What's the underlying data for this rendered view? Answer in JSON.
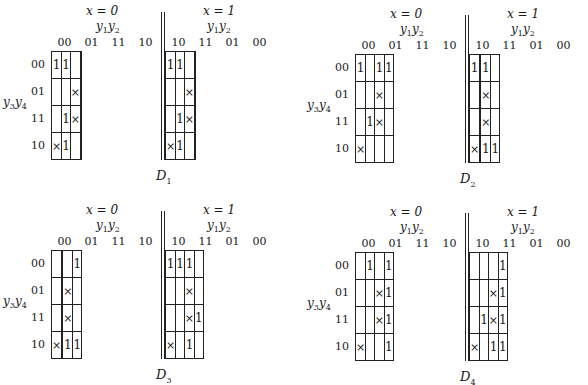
{
  "labels": {
    "x0": "x = 0",
    "x1": "x = 1",
    "col_var": "y",
    "col_var_sub1": "1",
    "col_var_sub2": "2",
    "row_var": "y",
    "row_var_sub1": "3",
    "row_var_sub2": "4",
    "left_cols": [
      "00",
      "01",
      "11",
      "10"
    ],
    "right_cols": [
      "10",
      "11",
      "01",
      "00"
    ],
    "rows": [
      "00",
      "01",
      "11",
      "10"
    ]
  },
  "maps": [
    {
      "title": "D",
      "title_sub": "1",
      "left": [
        [
          "1",
          "1",
          "",
          ""
        ],
        [
          "",
          "",
          "×",
          ""
        ],
        [
          "",
          "1",
          "×",
          ""
        ],
        [
          "×",
          "1",
          "",
          ""
        ]
      ],
      "right": [
        [
          "1",
          "1",
          "",
          ""
        ],
        [
          "",
          "",
          "×",
          ""
        ],
        [
          "",
          "1",
          "×",
          ""
        ],
        [
          "×",
          "1",
          "",
          ""
        ]
      ]
    },
    {
      "title": "D",
      "title_sub": "2",
      "left": [
        [
          "1",
          "",
          "1",
          "1"
        ],
        [
          "",
          "",
          "×",
          ""
        ],
        [
          "",
          "1",
          "×",
          ""
        ],
        [
          "×",
          "",
          "",
          ""
        ]
      ],
      "right": [
        [
          "1",
          "",
          "1",
          ""
        ],
        [
          "",
          "",
          "×",
          ""
        ],
        [
          "",
          "",
          "×",
          ""
        ],
        [
          "×",
          "",
          "1",
          "1"
        ]
      ]
    },
    {
      "title": "D",
      "title_sub": "3",
      "left": [
        [
          "",
          "",
          "",
          "1"
        ],
        [
          "",
          "",
          "×",
          ""
        ],
        [
          "",
          "",
          "×",
          ""
        ],
        [
          "×",
          "",
          "1",
          "1"
        ]
      ],
      "right": [
        [
          "1",
          "1",
          "1",
          ""
        ],
        [
          "",
          "",
          "×",
          ""
        ],
        [
          "",
          "",
          "×",
          "1"
        ],
        [
          "×",
          "",
          "1",
          ""
        ]
      ]
    },
    {
      "title": "D",
      "title_sub": "4",
      "left": [
        [
          "",
          "1",
          "",
          "1"
        ],
        [
          "",
          "",
          "×",
          "1"
        ],
        [
          "",
          "",
          "×",
          "1"
        ],
        [
          "×",
          "",
          "",
          "1"
        ]
      ],
      "right": [
        [
          "",
          "",
          "",
          "1"
        ],
        [
          "",
          "",
          "×",
          "1"
        ],
        [
          "",
          "1",
          "×",
          "1"
        ],
        [
          "×",
          "",
          "1",
          "1"
        ]
      ]
    }
  ],
  "chart_data": {
    "type": "table",
    "maps": [
      {
        "name": "D1",
        "x0": {
          "cols": [
            "00",
            "01",
            "11",
            "10"
          ],
          "rows": {
            "00": [
              "1",
              "1",
              "",
              ""
            ],
            "01": [
              "",
              "",
              "×",
              ""
            ],
            "11": [
              "",
              "1",
              "×",
              ""
            ],
            "10": [
              "×",
              "1",
              "",
              ""
            ]
          }
        },
        "x1": {
          "cols": [
            "10",
            "11",
            "01",
            "00"
          ],
          "rows": {
            "00": [
              "1",
              "1",
              "",
              ""
            ],
            "01": [
              "",
              "",
              "×",
              ""
            ],
            "11": [
              "",
              "1",
              "×",
              ""
            ],
            "10": [
              "×",
              "1",
              "",
              ""
            ]
          }
        }
      },
      {
        "name": "D2",
        "x0": {
          "cols": [
            "00",
            "01",
            "11",
            "10"
          ],
          "rows": {
            "00": [
              "1",
              "",
              "1",
              "1"
            ],
            "01": [
              "",
              "",
              "×",
              ""
            ],
            "11": [
              "",
              "1",
              "×",
              ""
            ],
            "10": [
              "×",
              "",
              "",
              ""
            ]
          }
        },
        "x1": {
          "cols": [
            "10",
            "11",
            "01",
            "00"
          ],
          "rows": {
            "00": [
              "1",
              "",
              "1",
              ""
            ],
            "01": [
              "",
              "",
              "×",
              ""
            ],
            "11": [
              "",
              "",
              "×",
              ""
            ],
            "10": [
              "×",
              "",
              "1",
              "1"
            ]
          }
        }
      },
      {
        "name": "D3",
        "x0": {
          "cols": [
            "00",
            "01",
            "11",
            "10"
          ],
          "rows": {
            "00": [
              "",
              "",
              "",
              "1"
            ],
            "01": [
              "",
              "",
              "×",
              ""
            ],
            "11": [
              "",
              "",
              "×",
              ""
            ],
            "10": [
              "×",
              "",
              "1",
              "1"
            ]
          }
        },
        "x1": {
          "cols": [
            "10",
            "11",
            "01",
            "00"
          ],
          "rows": {
            "00": [
              "1",
              "1",
              "1",
              ""
            ],
            "01": [
              "",
              "",
              "×",
              ""
            ],
            "11": [
              "",
              "",
              "×",
              "1"
            ],
            "10": [
              "×",
              "",
              "1",
              ""
            ]
          }
        }
      },
      {
        "name": "D4",
        "x0": {
          "cols": [
            "00",
            "01",
            "11",
            "10"
          ],
          "rows": {
            "00": [
              "",
              "1",
              "",
              "1"
            ],
            "01": [
              "",
              "",
              "×",
              "1"
            ],
            "11": [
              "",
              "",
              "×",
              "1"
            ],
            "10": [
              "×",
              "",
              "",
              "1"
            ]
          }
        },
        "x1": {
          "cols": [
            "10",
            "11",
            "01",
            "00"
          ],
          "rows": {
            "00": [
              "",
              "",
              "",
              "1"
            ],
            "01": [
              "",
              "",
              "×",
              "1"
            ],
            "11": [
              "",
              "1",
              "×",
              "1"
            ],
            "10": [
              "×",
              "",
              "1",
              "1"
            ]
          }
        }
      }
    ]
  }
}
